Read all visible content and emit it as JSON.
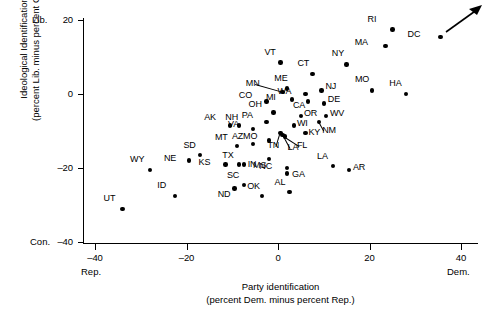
{
  "chart_data": {
    "type": "scatter",
    "title": "",
    "xlabel": "Party identification",
    "xlabel2": "(percent Dem. minus percent Rep.)",
    "ylabel": "Ideological Identification",
    "ylabel2": "(percent Lib. minus percent Cons.)",
    "xlim": [
      -48,
      46
    ],
    "ylim": [
      -45,
      23
    ],
    "xticks": [
      -40,
      -20,
      0,
      20,
      40
    ],
    "xtick_labels": [
      "-40",
      "-20",
      "0",
      "20",
      "40"
    ],
    "yticks": [
      20,
      0,
      -20,
      -40
    ],
    "ytick_labels": [
      "20",
      "0",
      "-20",
      "-40"
    ],
    "grid": false,
    "legend": "none",
    "x_axis_pole_low": "Rep.",
    "x_axis_pole_high": "Dem.",
    "y_axis_pole_high": "Lib.",
    "y_axis_pole_low": "Con.",
    "annotation_arrow": "upward-right trend arrow",
    "points": [
      {
        "label": "RI",
        "x": 25.0,
        "y": 17.5,
        "lx": -14,
        "ly": -11
      },
      {
        "label": "DC",
        "x": 35.5,
        "y": 15.5,
        "lx": -22,
        "ly": -4
      },
      {
        "label": "MA",
        "x": 23.5,
        "y": 13.0,
        "lx": -20,
        "ly": -5
      },
      {
        "label": "NY",
        "x": 15.0,
        "y": 8.0,
        "lx": -4,
        "ly": -12
      },
      {
        "label": "VT",
        "x": 0.5,
        "y": 8.5,
        "lx": -5,
        "ly": -12
      },
      {
        "label": "CT",
        "x": 7.5,
        "y": 5.5,
        "lx": -4,
        "ly": -12
      },
      {
        "label": "ME",
        "x": 2.0,
        "y": 1.5,
        "lx": -2,
        "ly": -12
      },
      {
        "label": "MN",
        "x": 1.0,
        "y": 0.5,
        "lx": -26,
        "ly": -10,
        "leader": true
      },
      {
        "label": "MO",
        "x": 20.5,
        "y": 1.0,
        "lx": -6,
        "ly": -12
      },
      {
        "label": "NJ",
        "x": 9.5,
        "y": 1.0,
        "lx": 4,
        "ly": -5
      },
      {
        "label": "WA",
        "x": 6.0,
        "y": 0.0,
        "lx": -17,
        "ly": -4
      },
      {
        "label": "HA",
        "x": 28.0,
        "y": 0.0,
        "lx": -6,
        "ly": -12
      },
      {
        "label": "CO",
        "x": -2.5,
        "y": -2.0,
        "lx": -17,
        "ly": -7
      },
      {
        "label": "MI",
        "x": 3.0,
        "y": -1.5,
        "lx": -15,
        "ly": -4
      },
      {
        "label": "DE",
        "x": 10.0,
        "y": -2.5,
        "lx": 4,
        "ly": -5
      },
      {
        "label": "CA",
        "x": 6.5,
        "y": -2.0,
        "lx": -4,
        "ly": 3
      },
      {
        "label": "OH",
        "x": -1.0,
        "y": -5.0,
        "lx": -14,
        "ly": -10
      },
      {
        "label": "OR",
        "x": 5.0,
        "y": -6.0,
        "lx": 3,
        "ly": -4
      },
      {
        "label": "WV",
        "x": 10.5,
        "y": -6.0,
        "lx": 4,
        "ly": -4
      },
      {
        "label": "AK",
        "x": -10.5,
        "y": -8.5,
        "lx": -15,
        "ly": -10
      },
      {
        "label": "NH",
        "x": -8.5,
        "y": -8.5,
        "lx": -3,
        "ly": -10
      },
      {
        "label": "PA",
        "x": -2.5,
        "y": -7.5,
        "lx": -14,
        "ly": -8
      },
      {
        "label": "WI",
        "x": 3.5,
        "y": -8.5,
        "lx": 3,
        "ly": -4
      },
      {
        "label": "NM",
        "x": 9.0,
        "y": -7.5,
        "lx": 3,
        "ly": 7,
        "leader": true
      },
      {
        "label": "VA",
        "x": -5.5,
        "y": -9.5,
        "lx": -14,
        "ly": -6
      },
      {
        "label": "KY",
        "x": 6.0,
        "y": -10.5,
        "lx": 3,
        "ly": -2
      },
      {
        "label": "MO2",
        "x": -2.0,
        "y": -12.5,
        "lx": -15,
        "ly": -5
      },
      {
        "label": "MT",
        "x": -9.0,
        "y": -14.0,
        "lx": -11,
        "ly": -10
      },
      {
        "label": "AZ",
        "x": -5.5,
        "y": -13.5,
        "lx": -10,
        "ly": -9
      },
      {
        "label": "TN",
        "x": 0.5,
        "y": -10.5,
        "lx": -2,
        "ly": 11,
        "leader": true
      },
      {
        "label": "LA",
        "x": 1.0,
        "y": -11.0,
        "lx": 5,
        "ly": 11,
        "leader": true
      },
      {
        "label": "FL",
        "x": 1.5,
        "y": -11.5,
        "lx": 12,
        "ly": 7,
        "leader": true
      },
      {
        "label": "SD",
        "x": -17.0,
        "y": -16.5,
        "lx": -6,
        "ly": -11
      },
      {
        "label": "NE",
        "x": -19.5,
        "y": -18.0,
        "lx": -14,
        "ly": -4
      },
      {
        "label": "TX",
        "x": -8.5,
        "y": -19.0,
        "lx": -6,
        "ly": -10
      },
      {
        "label": "MS",
        "x": -2.0,
        "y": -17.5,
        "lx": -5,
        "ly": 5
      },
      {
        "label": "KS",
        "x": -11.5,
        "y": -19.0,
        "lx": -16,
        "ly": -3
      },
      {
        "label": "IN",
        "x": -7.5,
        "y": -19.0,
        "lx": 4,
        "ly": -1
      },
      {
        "label": "WY",
        "x": -28.0,
        "y": -20.5,
        "lx": -9,
        "ly": -12
      },
      {
        "label": "NC",
        "x": 2.0,
        "y": -20.0,
        "lx": -17,
        "ly": -3
      },
      {
        "label": "LA2",
        "x": 12.0,
        "y": -19.5,
        "lx": -5,
        "ly": -11
      },
      {
        "label": "AR",
        "x": 15.5,
        "y": -20.5,
        "lx": 4,
        "ly": -4
      },
      {
        "label": "GA",
        "x": 2.0,
        "y": -21.5,
        "lx": 5,
        "ly": -1
      },
      {
        "label": "SC",
        "x": -7.5,
        "y": -24.5,
        "lx": -6,
        "ly": -11
      },
      {
        "label": "ID",
        "x": -22.5,
        "y": -27.5,
        "lx": -7,
        "ly": -12
      },
      {
        "label": "ND",
        "x": -9.5,
        "y": -25.5,
        "lx": -6,
        "ly": 5
      },
      {
        "label": "OK",
        "x": -3.5,
        "y": -27.5,
        "lx": -4,
        "ly": -11
      },
      {
        "label": "AL",
        "x": 2.5,
        "y": -26.5,
        "lx": -4,
        "ly": -11
      },
      {
        "label": "UT",
        "x": -34.0,
        "y": -31.0,
        "lx": -8,
        "ly": -12
      }
    ]
  }
}
